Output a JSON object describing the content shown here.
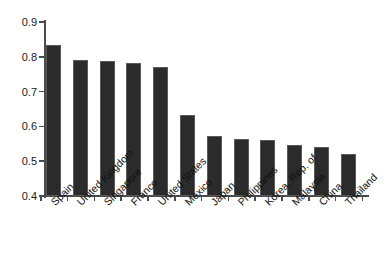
{
  "chart_data": {
    "type": "bar",
    "title": "",
    "subtitle": "",
    "xlabel": "",
    "ylabel": "",
    "ylim": [
      0.4,
      0.9
    ],
    "ytick_step": 0.1,
    "ytick_labels": [
      "0.9",
      "0.8",
      "0.7",
      "0.6",
      "0.5",
      "0.4"
    ],
    "ytick_values": [
      0.9,
      0.8,
      0.7,
      0.6,
      0.5,
      0.4
    ],
    "grid": false,
    "legend": null,
    "legend_position": "none",
    "bar_color": "#2b2b2b",
    "bar_edge_color": "#5a5a5a",
    "axis_color": "#4a4a4a",
    "background_color": "#ffffff",
    "xtick_label_rotation": -45,
    "categories": [
      "Spain",
      "United Kingdom",
      "Singapore",
      "France",
      "United States",
      "Mexico",
      "Japan",
      "Philippines",
      "Korea, Rep. of",
      "Malaysia",
      "China",
      "Thailand"
    ],
    "values": [
      0.835,
      0.79,
      0.788,
      0.782,
      0.771,
      0.632,
      0.572,
      0.565,
      0.56,
      0.548,
      0.54,
      0.522
    ]
  }
}
